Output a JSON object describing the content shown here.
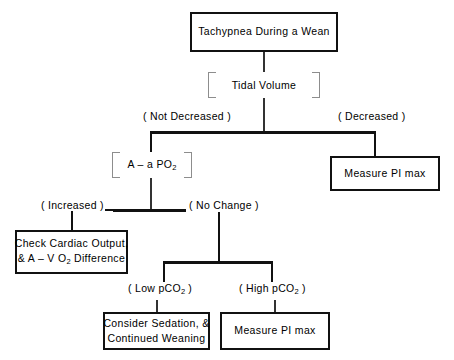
{
  "diagram": {
    "type": "flowchart",
    "nodes": {
      "root": {
        "label": "Tachypnea During a Wean"
      },
      "tidal_volume": {
        "label": "Tidal Volume"
      },
      "aa_po2": {
        "label_pre": "A – a  PO",
        "label_sub": "2"
      },
      "measure_pi_max_right": {
        "label": "Measure PI max"
      },
      "check_cardiac": {
        "line1": "Check Cardiac Output,",
        "line2_pre": "&  A – V O",
        "line2_sub": "2",
        "line2_post": " Difference"
      },
      "consider_sedation": {
        "line1": "Consider  Sedation, &",
        "line2": "Continued Weaning"
      },
      "measure_pi_max_bottom": {
        "label": "Measure PI max"
      }
    },
    "edge_labels": {
      "not_decreased": "( Not Decreased )",
      "decreased": "( Decreased )",
      "increased": "( Increased )",
      "no_change": "( No Change )",
      "low_pco2_pre": "( Low pCO",
      "low_pco2_sub": "2",
      "low_pco2_post": " )",
      "high_pco2_pre": "( High pCO",
      "high_pco2_sub": "2",
      "high_pco2_post": " )"
    },
    "colors": {
      "background": "#ffffff",
      "stroke": "#111111",
      "bracket": "#8d8d8d",
      "text": "#000000"
    }
  }
}
